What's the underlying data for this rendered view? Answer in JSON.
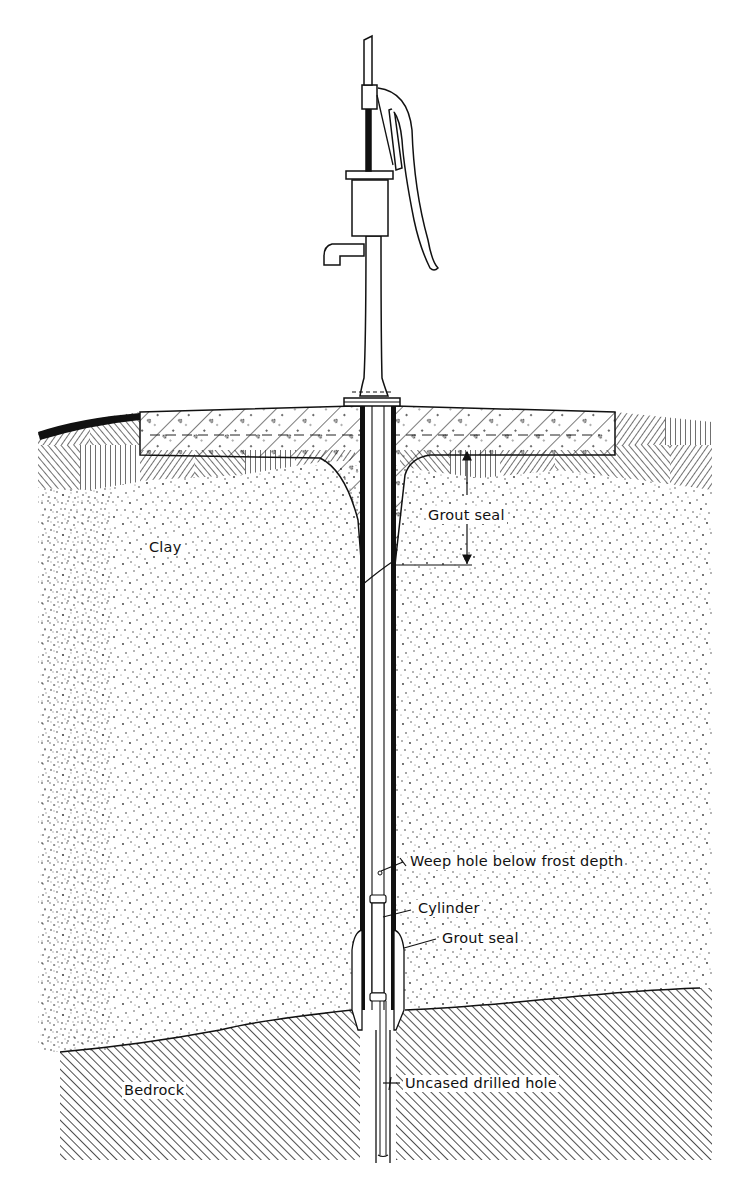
{
  "diagram": {
    "colors": {
      "ink": "#111111",
      "paper": "#ffffff"
    },
    "layers": [
      {
        "id": "topsoil",
        "pattern": "basket-weave hatch"
      },
      {
        "id": "concrete-slab",
        "pattern": "diagonal hatch with aggregate"
      },
      {
        "id": "clay",
        "pattern": "stipple"
      },
      {
        "id": "bedrock",
        "pattern": "fine diagonal hatch"
      }
    ],
    "labels": {
      "clay": "Clay",
      "grout_seal_top": "Grout seal",
      "weep_hole": "Weep hole below frost depth",
      "cylinder": "Cylinder",
      "grout_seal_bottom": "Grout seal",
      "bedrock": "Bedrock",
      "uncased_hole": "Uncased drilled hole"
    }
  }
}
